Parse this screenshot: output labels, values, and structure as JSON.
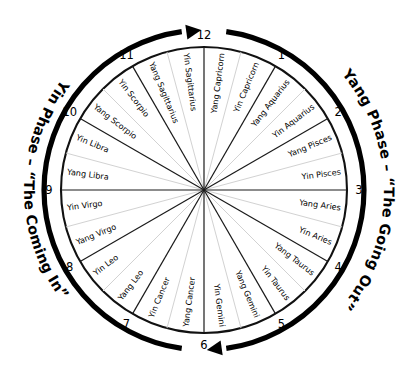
{
  "diagram": {
    "center": {
      "x": 204,
      "y": 190
    },
    "radius": 143,
    "arc_radius": 160,
    "phase_text_radius": 180,
    "colors": {
      "outline": "#111111",
      "sector_divider": "#1a1a1a",
      "half_divider": "#d2d2d2",
      "arc": "#000000",
      "text": "#000000",
      "background": "#ffffff"
    },
    "phases": [
      {
        "id": "yang-phase",
        "label": "Yang Phase – “The Going Out”",
        "side": "right",
        "arc_start_deg": 8,
        "arc_end_deg": 172,
        "arrow_at_deg": 172,
        "direction": "clockwise"
      },
      {
        "id": "yin-phase",
        "label": "Yin Phase – “The Coming In”",
        "side": "left",
        "arc_start_deg": 188,
        "arc_end_deg": 352,
        "arrow_at_deg": 352,
        "direction": "counter-clockwise"
      }
    ],
    "hour_markers": [
      "12",
      "1",
      "2",
      "3",
      "4",
      "5",
      "6",
      "7",
      "8",
      "9",
      "10",
      "11"
    ],
    "sectors": [
      {
        "hour_start": "12",
        "hour_end": "1",
        "first_half": "Yang Capricorn",
        "second_half": "Yin Capricorn"
      },
      {
        "hour_start": "1",
        "hour_end": "2",
        "first_half": "Yang Aquarius",
        "second_half": "Yin Aquarius"
      },
      {
        "hour_start": "2",
        "hour_end": "3",
        "first_half": "Yang Pisces",
        "second_half": "Yin Pisces"
      },
      {
        "hour_start": "3",
        "hour_end": "4",
        "first_half": "Yang Aries",
        "second_half": "Yin Aries"
      },
      {
        "hour_start": "4",
        "hour_end": "5",
        "first_half": "Yang Taurus",
        "second_half": "Yin Taurus"
      },
      {
        "hour_start": "5",
        "hour_end": "6",
        "first_half": "Yang Gemini",
        "second_half": "Yin Gemini"
      },
      {
        "hour_start": "6",
        "hour_end": "7",
        "first_half": "Yang Cancer",
        "second_half": "Yin Cancer"
      },
      {
        "hour_start": "7",
        "hour_end": "8",
        "first_half": "Yang Leo",
        "second_half": "Yin Leo"
      },
      {
        "hour_start": "8",
        "hour_end": "9",
        "first_half": "Yang Virgo",
        "second_half": "Yin Virgo"
      },
      {
        "hour_start": "9",
        "hour_end": "10",
        "first_half": "Yang Libra",
        "second_half": "Yin Libra"
      },
      {
        "hour_start": "10",
        "hour_end": "11",
        "first_half": "Yang Scorpio",
        "second_half": "Yin Scorpio"
      },
      {
        "hour_start": "11",
        "hour_end": "12",
        "first_half": "Yang Sagittarius",
        "second_half": "Yin Sagittarius"
      }
    ],
    "sign_labels_clockwise_from_12": [
      "Yang Capricorn",
      "Yin Capricorn",
      "Yang Aquarius",
      "Yin Aquarius",
      "Yang Pisces",
      "Yin Pisces",
      "Yang Aries",
      "Yin Aries",
      "Yang Taurus",
      "Yin Taurus",
      "Yang Gemini",
      "Yin Gemini",
      "Yang Cancer",
      "Yin Cancer",
      "Yang Leo",
      "Yin Leo",
      "Yang Virgo",
      "Yin Virgo",
      "Yang Libra",
      "Yin Libra",
      "Yang Scorpio",
      "Yin Scorpio",
      "Yang Sagittarius",
      "Yin Sagittarius"
    ]
  }
}
